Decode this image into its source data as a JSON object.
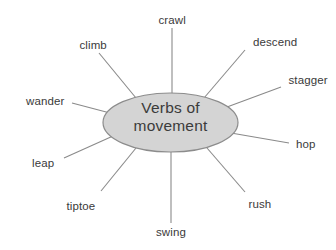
{
  "diagram": {
    "type": "word-web",
    "center": {
      "line1": "Verbs of",
      "line2": "movement",
      "fill_color": "#d4d4d4",
      "border_color": "#8c8c8c",
      "text_color": "#3b3b3b"
    },
    "line_color": "#8a8a8a",
    "background_color": "#ffffff",
    "nodes": [
      {
        "label": "crawl",
        "x": 172,
        "y": 20,
        "align": "center"
      },
      {
        "label": "climb",
        "x": 93,
        "y": 45,
        "align": "center"
      },
      {
        "label": "descend",
        "x": 275,
        "y": 42,
        "align": "center"
      },
      {
        "label": "stagger",
        "x": 308,
        "y": 80,
        "align": "center"
      },
      {
        "label": "wander",
        "x": 45,
        "y": 101,
        "align": "center"
      },
      {
        "label": "hop",
        "x": 306,
        "y": 144,
        "align": "center"
      },
      {
        "label": "leap",
        "x": 43,
        "y": 163,
        "align": "center"
      },
      {
        "label": "tiptoe",
        "x": 81,
        "y": 206,
        "align": "center"
      },
      {
        "label": "rush",
        "x": 260,
        "y": 204,
        "align": "center"
      },
      {
        "label": "swing",
        "x": 171,
        "y": 232,
        "align": "center"
      }
    ]
  }
}
